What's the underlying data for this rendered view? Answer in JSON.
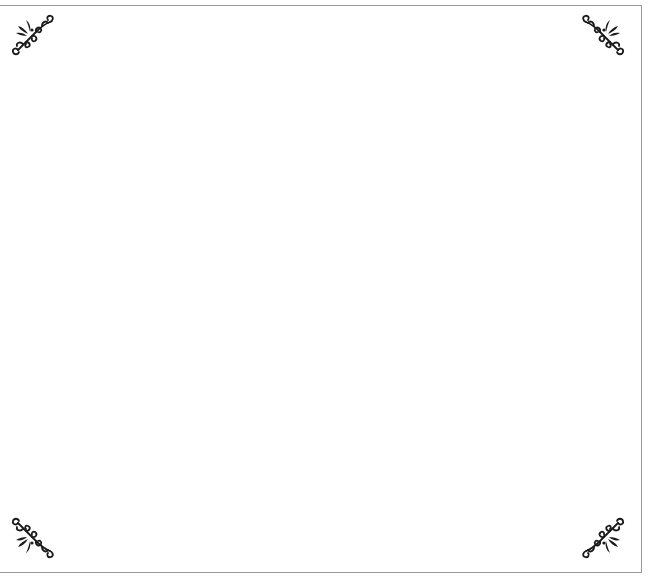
{
  "page": {
    "background_color": "#ffffff",
    "border_color": "#9a9a9a",
    "ornament_color": "#1a1a1a"
  },
  "ornaments": [
    {
      "position": "top-left",
      "icon": "flourish-icon"
    },
    {
      "position": "top-right",
      "icon": "flourish-icon"
    },
    {
      "position": "bottom-left",
      "icon": "flourish-icon"
    },
    {
      "position": "bottom-right",
      "icon": "flourish-icon"
    }
  ]
}
